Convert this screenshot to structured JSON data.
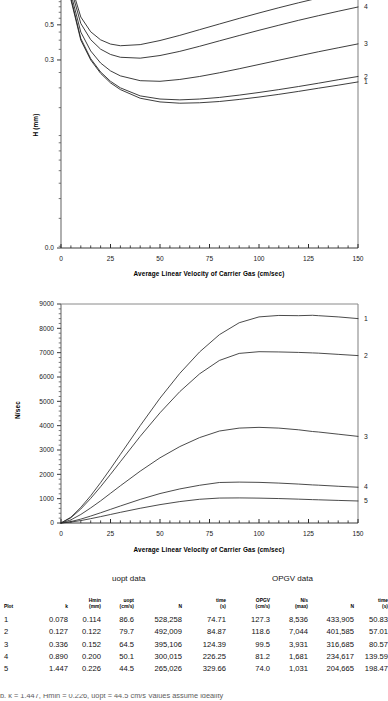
{
  "figure": {
    "charts": [
      {
        "id": "h-vs-velocity",
        "ylabel": "H (mm)",
        "xlabel": "Average Linear Velocity of Carrier Gas (cm/sec)",
        "curve_labels": [
          "5",
          "4",
          "3",
          "2",
          "1"
        ]
      },
      {
        "id": "n-per-sec-vs-velocity",
        "ylabel": "N/sec",
        "xlabel": "Average Linear Velocity of Carrier Gas (cm/sec)",
        "curve_labels": [
          "1",
          "2",
          "3",
          "4",
          "5"
        ]
      }
    ],
    "section_captions": {
      "left": "uopt data",
      "right": "OPGV data"
    },
    "table": {
      "headers": [
        {
          "name": "Plot",
          "unit": ""
        },
        {
          "name": "k",
          "unit": ""
        },
        {
          "name": "Hmin",
          "unit": "(mm)"
        },
        {
          "name": "uopt",
          "unit": "(cm/s)"
        },
        {
          "name": "N",
          "unit": ""
        },
        {
          "name": "time",
          "unit": "(s)"
        },
        {
          "name": "OPGV",
          "unit": "(cm/s)"
        },
        {
          "name": "N/s",
          "unit": "(max)"
        },
        {
          "name": "N",
          "unit": ""
        },
        {
          "name": "time",
          "unit": "(s)"
        }
      ],
      "rows": [
        [
          "1",
          "0.078",
          "0.114",
          "86.6",
          "528,258",
          "74.71",
          "127.3",
          "8,536",
          "433,905",
          "50.83"
        ],
        [
          "2",
          "0.127",
          "0.122",
          "79.7",
          "492,009",
          "84.87",
          "118.6",
          "7,044",
          "401,585",
          "57.01"
        ],
        [
          "3",
          "0.336",
          "0.152",
          "64.5",
          "395,106",
          "124.39",
          "99.5",
          "3,931",
          "316,685",
          "80.57"
        ],
        [
          "4",
          "0.890",
          "0.200",
          "50.1",
          "300,015",
          "226.25",
          "81.2",
          "1,681",
          "234,617",
          "139.59"
        ],
        [
          "5",
          "1.447",
          "0.226",
          "44.5",
          "265,026",
          "329.66",
          "74.0",
          "1,031",
          "204,665",
          "198.47"
        ]
      ]
    },
    "footnote": "b. k = 1.447, Hmin = 0.226, uopt = 44.5 cm/s  Values assume ideality"
  },
  "chart_data": [
    {
      "type": "line",
      "id": "h-vs-velocity",
      "title": "",
      "xlabel": "Average Linear Velocity of Carrier Gas (cm/sec)",
      "ylabel": "H (mm)",
      "xlim": [
        0,
        150
      ],
      "ylim": [
        0.0,
        1.2
      ],
      "yscale": "log-like",
      "xticks": [
        0,
        25,
        50,
        75,
        100,
        125,
        150
      ],
      "yticks": [
        0.0,
        0.3,
        0.5,
        0.8,
        1.0
      ],
      "grid": false,
      "legend": "right-edge-curve-numbers",
      "x": [
        2,
        5,
        10,
        15,
        20,
        25,
        30,
        40,
        50,
        60,
        70,
        80,
        90,
        100,
        110,
        120,
        130,
        140,
        150
      ],
      "series": [
        {
          "name": "1",
          "k": 0.078,
          "values": [
            1.4,
            0.72,
            0.4,
            0.3,
            0.247,
            0.215,
            0.195,
            0.172,
            0.163,
            0.16,
            0.161,
            0.164,
            0.169,
            0.175,
            0.182,
            0.19,
            0.199,
            0.208,
            0.218
          ]
        },
        {
          "name": "2",
          "k": 0.127,
          "values": [
            1.43,
            0.74,
            0.41,
            0.306,
            0.252,
            0.22,
            0.2,
            0.178,
            0.17,
            0.168,
            0.17,
            0.174,
            0.18,
            0.187,
            0.195,
            0.204,
            0.214,
            0.225,
            0.236
          ]
        },
        {
          "name": "3",
          "k": 0.336,
          "values": [
            1.5,
            0.79,
            0.45,
            0.342,
            0.287,
            0.256,
            0.238,
            0.222,
            0.22,
            0.226,
            0.236,
            0.249,
            0.264,
            0.281,
            0.299,
            0.318,
            0.338,
            0.358,
            0.379
          ]
        },
        {
          "name": "4",
          "k": 0.89,
          "values": [
            1.57,
            0.85,
            0.51,
            0.403,
            0.351,
            0.325,
            0.312,
            0.308,
            0.32,
            0.34,
            0.366,
            0.396,
            0.428,
            0.462,
            0.497,
            0.534,
            0.571,
            0.609,
            0.648
          ]
        },
        {
          "name": "5",
          "k": 1.447,
          "values": [
            1.62,
            0.9,
            0.56,
            0.452,
            0.402,
            0.378,
            0.369,
            0.375,
            0.398,
            0.429,
            0.466,
            0.506,
            0.549,
            0.594,
            0.641,
            0.689,
            0.738,
            0.788,
            0.838
          ]
        }
      ]
    },
    {
      "type": "line",
      "id": "n-per-sec-vs-velocity",
      "title": "",
      "xlabel": "Average Linear Velocity of Carrier Gas (cm/sec)",
      "ylabel": "N/sec",
      "xlim": [
        0,
        150
      ],
      "ylim": [
        0,
        9000
      ],
      "yscale": "linear",
      "xticks": [
        0,
        25,
        50,
        75,
        100,
        125,
        150
      ],
      "yticks": [
        0,
        1000,
        2000,
        3000,
        4000,
        5000,
        6000,
        7000,
        8000,
        9000
      ],
      "grid": false,
      "legend": "right-edge-curve-numbers",
      "x": [
        0,
        5,
        10,
        15,
        20,
        25,
        30,
        40,
        50,
        60,
        70,
        80,
        90,
        100,
        110,
        120,
        127,
        130,
        140,
        150
      ],
      "series": [
        {
          "name": "1",
          "k": 0.078,
          "peak_x": 127.3,
          "peak_y": 8536,
          "values": [
            0,
            240,
            640,
            1120,
            1660,
            2230,
            2820,
            4000,
            5130,
            6150,
            7030,
            7740,
            8230,
            8470,
            8530,
            8520,
            8536,
            8520,
            8470,
            8400
          ]
        },
        {
          "name": "2",
          "k": 0.127,
          "peak_x": 118.6,
          "peak_y": 7044,
          "values": [
            0,
            215,
            575,
            1010,
            1490,
            2000,
            2520,
            3560,
            4530,
            5400,
            6130,
            6680,
            6970,
            7040,
            7030,
            7010,
            6990,
            6980,
            6930,
            6880
          ]
        },
        {
          "name": "3",
          "k": 0.336,
          "peak_x": 99.5,
          "peak_y": 3931,
          "values": [
            0,
            130,
            350,
            620,
            910,
            1220,
            1530,
            2130,
            2680,
            3140,
            3510,
            3780,
            3900,
            3931,
            3900,
            3830,
            3760,
            3740,
            3650,
            3560
          ]
        },
        {
          "name": "4",
          "k": 0.89,
          "peak_x": 81.2,
          "peak_y": 1681,
          "values": [
            0,
            60,
            160,
            285,
            420,
            560,
            700,
            970,
            1210,
            1400,
            1550,
            1665,
            1681,
            1670,
            1640,
            1600,
            1565,
            1555,
            1510,
            1470
          ]
        },
        {
          "name": "5",
          "k": 1.447,
          "peak_x": 74.0,
          "peak_y": 1031,
          "values": [
            0,
            38,
            100,
            178,
            262,
            350,
            438,
            605,
            755,
            880,
            975,
            1025,
            1031,
            1022,
            1005,
            980,
            960,
            953,
            928,
            905
          ]
        }
      ]
    }
  ]
}
